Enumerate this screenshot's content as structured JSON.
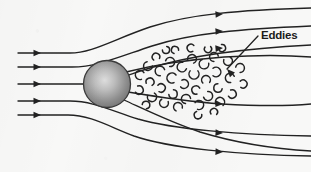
{
  "figure": {
    "background_color": "#f8f8f7",
    "ink_color": "#222222",
    "annotations": [
      {
        "id": "eddies",
        "label": "Eddies",
        "label_x": 261,
        "label_y": 39,
        "leader": {
          "x1": 258,
          "y1": 36,
          "x2": 227,
          "y2": 69
        },
        "arrow_angle_deg": 227
      }
    ],
    "sphere": {
      "name": "sphere-obstacle",
      "cx": 107,
      "cy": 84,
      "r": 23.5,
      "fill_center": "#d8d8d8",
      "fill_edge": "#6e6e6e",
      "stroke": "#3a3a3a",
      "highlight_x": 104,
      "highlight_y": 80
    },
    "streamlines": [
      {
        "name": "streamline-top-1",
        "path": "M 18 53 L 70 53 C 92 53 112 40 150 27 C 190 14 240 10 311 8",
        "arrows": [
          {
            "x": 41,
            "y": 53,
            "angle": 0
          },
          {
            "x": 223,
            "y": 14,
            "angle": -4
          }
        ]
      },
      {
        "name": "streamline-top-2",
        "path": "M 18 67 L 72 67 C 96 67 116 58 152 46 C 192 33 242 29 311 26",
        "arrows": [
          {
            "x": 41,
            "y": 67,
            "angle": 0
          },
          {
            "x": 223,
            "y": 31,
            "angle": -4
          }
        ]
      },
      {
        "name": "streamline-wake-upper",
        "path": "M 18 84 L 86 84 C 106 84 124 76 150 68 C 182 58 232 49 311 45",
        "arrows": [
          {
            "x": 41,
            "y": 84,
            "angle": 0
          },
          {
            "x": 223,
            "y": 48,
            "angle": -5
          }
        ]
      },
      {
        "name": "streamline-wake-lower",
        "path": "M 128 92 C 152 96 182 101 222 104 C 258 106 288 106 311 104",
        "arrows": [
          {
            "x": 223,
            "y": 104,
            "angle": 3
          }
        ]
      },
      {
        "name": "streamline-bottom-1",
        "path": "M 18 101 L 70 101 C 92 101 110 110 138 119 C 172 129 240 135 311 136",
        "arrows": [
          {
            "x": 41,
            "y": 101,
            "angle": 0
          },
          {
            "x": 223,
            "y": 133,
            "angle": 3
          }
        ]
      },
      {
        "name": "streamline-bottom-2",
        "path": "M 18 115 L 68 115 C 90 115 108 126 134 136 C 168 148 240 155 311 156",
        "arrows": [
          {
            "x": 41,
            "y": 115,
            "angle": 0
          },
          {
            "x": 223,
            "y": 152,
            "angle": 3
          }
        ]
      },
      {
        "name": "streamline-wake-edge-upper",
        "path": "M 126 72 C 150 66 184 60 224 57 C 256 55 286 55 311 57",
        "arrows": []
      },
      {
        "name": "streamline-bottom-3",
        "path": "M 124 100 C 146 110 170 122 200 132 C 236 143 276 149 311 151",
        "arrows": []
      }
    ],
    "eddies": [
      {
        "x": 140,
        "y": 75,
        "r": 4.6,
        "rot": 20
      },
      {
        "x": 139,
        "y": 90,
        "r": 4.2,
        "rot": 200
      },
      {
        "x": 148,
        "y": 66,
        "r": 4.4,
        "rot": 310
      },
      {
        "x": 150,
        "y": 82,
        "r": 4.0,
        "rot": 110
      },
      {
        "x": 152,
        "y": 97,
        "r": 4.6,
        "rot": 250
      },
      {
        "x": 160,
        "y": 71,
        "r": 4.8,
        "rot": 35
      },
      {
        "x": 161,
        "y": 88,
        "r": 4.2,
        "rot": 170
      },
      {
        "x": 164,
        "y": 103,
        "r": 4.4,
        "rot": 290
      },
      {
        "x": 170,
        "y": 62,
        "r": 4.6,
        "rot": 145
      },
      {
        "x": 172,
        "y": 78,
        "r": 5.0,
        "rot": 15
      },
      {
        "x": 173,
        "y": 94,
        "r": 4.2,
        "rot": 225
      },
      {
        "x": 178,
        "y": 107,
        "r": 4.4,
        "rot": 65
      },
      {
        "x": 182,
        "y": 67,
        "r": 4.8,
        "rot": 330
      },
      {
        "x": 184,
        "y": 84,
        "r": 4.4,
        "rot": 190
      },
      {
        "x": 186,
        "y": 99,
        "r": 4.6,
        "rot": 45
      },
      {
        "x": 192,
        "y": 59,
        "r": 4.4,
        "rot": 120
      },
      {
        "x": 194,
        "y": 74,
        "r": 5.0,
        "rot": 270
      },
      {
        "x": 196,
        "y": 90,
        "r": 4.2,
        "rot": 25
      },
      {
        "x": 199,
        "y": 105,
        "r": 4.6,
        "rot": 160
      },
      {
        "x": 204,
        "y": 64,
        "r": 4.8,
        "rot": 300
      },
      {
        "x": 206,
        "y": 80,
        "r": 4.4,
        "rot": 85
      },
      {
        "x": 208,
        "y": 96,
        "r": 4.6,
        "rot": 215
      },
      {
        "x": 214,
        "y": 57,
        "r": 4.4,
        "rot": 40
      },
      {
        "x": 216,
        "y": 72,
        "r": 4.8,
        "rot": 180
      },
      {
        "x": 218,
        "y": 88,
        "r": 4.2,
        "rot": 320
      },
      {
        "x": 220,
        "y": 102,
        "r": 4.6,
        "rot": 100
      },
      {
        "x": 228,
        "y": 61,
        "r": 4.4,
        "rot": 250
      },
      {
        "x": 230,
        "y": 78,
        "r": 4.6,
        "rot": 30
      },
      {
        "x": 232,
        "y": 94,
        "r": 4.2,
        "rot": 200
      },
      {
        "x": 240,
        "y": 68,
        "r": 4.4,
        "rot": 140
      },
      {
        "x": 156,
        "y": 57,
        "r": 3.8,
        "rot": 75
      },
      {
        "x": 166,
        "y": 50,
        "r": 3.6,
        "rot": 230
      },
      {
        "x": 191,
        "y": 48,
        "r": 3.8,
        "rot": 10
      },
      {
        "x": 208,
        "y": 49,
        "r": 3.6,
        "rot": 265
      },
      {
        "x": 146,
        "y": 105,
        "r": 3.8,
        "rot": 135
      },
      {
        "x": 175,
        "y": 50,
        "r": 3.6,
        "rot": 55
      },
      {
        "x": 243,
        "y": 84,
        "r": 4.0,
        "rot": 175
      },
      {
        "x": 198,
        "y": 115,
        "r": 3.8,
        "rot": 300
      },
      {
        "x": 214,
        "y": 112,
        "r": 3.6,
        "rot": 95
      },
      {
        "x": 222,
        "y": 48,
        "r": 3.6,
        "rot": 210
      }
    ]
  }
}
